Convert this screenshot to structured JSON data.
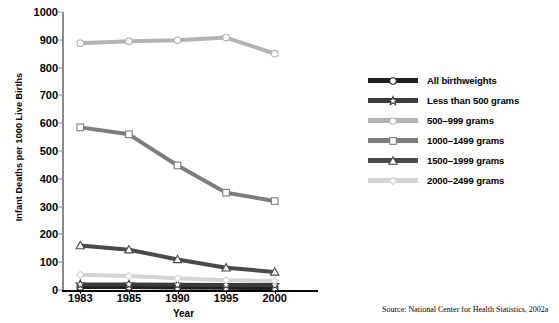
{
  "chart_data": {
    "type": "line",
    "title": "",
    "xlabel": "Year",
    "ylabel": "Infant Deaths per 1000 Live Births",
    "categories": [
      "1983",
      "1985",
      "1990",
      "1995",
      "2000"
    ],
    "ylim": [
      0,
      1000
    ],
    "yticks": [
      0,
      100,
      200,
      300,
      400,
      500,
      600,
      700,
      800,
      900,
      1000
    ],
    "grid": false,
    "legend_position": "right",
    "series": [
      {
        "name": "All birthweights",
        "values": [
          11,
          11,
          9,
          8,
          7
        ],
        "color": "#231f20",
        "marker": "circle"
      },
      {
        "name": "Less than 500 grams",
        "values": [
          20,
          20,
          19,
          18,
          18
        ],
        "color": "#3b3b3b",
        "marker": "star"
      },
      {
        "name": "500–999 grams",
        "values": [
          888,
          895,
          898,
          908,
          850
        ],
        "color": "#b3b3b3",
        "marker": "circle"
      },
      {
        "name": "1000–1499 grams",
        "values": [
          585,
          560,
          448,
          350,
          320
        ],
        "color": "#7d7d7d",
        "marker": "square"
      },
      {
        "name": "1500–1999 grams",
        "values": [
          160,
          145,
          110,
          80,
          65
        ],
        "color": "#4a4a4a",
        "marker": "triangle"
      },
      {
        "name": "2000–2499 grams",
        "values": [
          55,
          50,
          42,
          35,
          32
        ],
        "color": "#d4d4d4",
        "marker": "diamond"
      }
    ]
  },
  "source": {
    "text": "Source: National Center for Health Statistics, 2002a"
  }
}
